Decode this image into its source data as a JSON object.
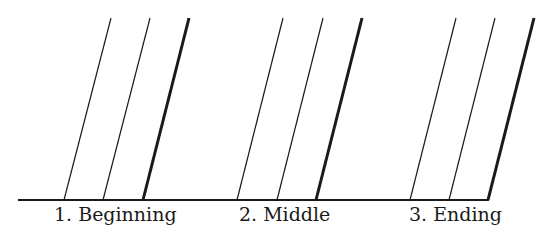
{
  "diagram": {
    "stroke_color": "#1a1a1a",
    "baseline": {
      "x1": 18,
      "x2": 489,
      "y": 200
    },
    "top_y": 18,
    "groups": [
      {
        "label": "1. Beginning",
        "label_x": 54,
        "lines": [
          {
            "x_bottom": 64,
            "x_top": 111,
            "weight": "thin"
          },
          {
            "x_bottom": 103,
            "x_top": 150,
            "weight": "thin"
          },
          {
            "x_bottom": 143,
            "x_top": 189,
            "weight": "thick"
          }
        ]
      },
      {
        "label": "2. Middle",
        "label_x": 239,
        "lines": [
          {
            "x_bottom": 237,
            "x_top": 283,
            "weight": "thin"
          },
          {
            "x_bottom": 277,
            "x_top": 323,
            "weight": "thin"
          },
          {
            "x_bottom": 316,
            "x_top": 362,
            "weight": "thick"
          }
        ]
      },
      {
        "label": "3. Ending",
        "label_x": 409,
        "lines": [
          {
            "x_bottom": 410,
            "x_top": 456,
            "weight": "thin"
          },
          {
            "x_bottom": 449,
            "x_top": 495,
            "weight": "thin"
          },
          {
            "x_bottom": 488,
            "x_top": 534,
            "weight": "thick"
          }
        ]
      }
    ]
  }
}
